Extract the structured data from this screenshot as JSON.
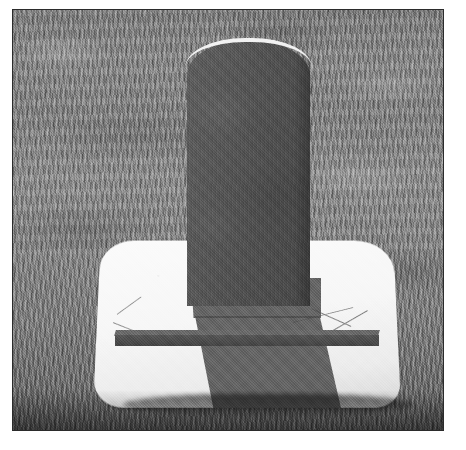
{
  "page": {
    "background_color": "#ffffff",
    "width": 466,
    "height": 450
  },
  "photo": {
    "title": "Grave marker on concrete base in mown cemetery lawn",
    "medium": "black-and-white photograph",
    "border_color": "#2b2b2b",
    "frame": {
      "left": 12,
      "top": 9,
      "width": 432,
      "height": 422
    }
  },
  "scene": {
    "background": {
      "name": "grass-lawn",
      "description": "mown turf with horizontal mower bands, mottled light and dark patches",
      "tone_color": "#868686"
    },
    "slab": {
      "name": "concrete-base-slab",
      "description": "bright white rounded-corner concrete foundation slab set flush in the grass",
      "color": "#f7f7f7",
      "edge_color": "#b4b4b4"
    },
    "headstone": {
      "name": "arched-headstone",
      "description": "upright dark granite marker with rounded arched top and bright sunlit rim",
      "color": "#535353",
      "highlight_color": "#f2f2f2",
      "inscription_lines": [
        "",
        "",
        "",
        ""
      ],
      "inscription_legible": false
    },
    "footstone": {
      "name": "flat-footstone-bar",
      "description": "low dark horizontal stone bar lying across the slab in front of the headstone",
      "color": "#4d4d4d"
    },
    "cast_shadow": {
      "name": "headstone-cast-shadow",
      "description": "long trapezoidal shadow thrown by the headstone down and to the right across the white slab",
      "color": "#4e4e4e"
    },
    "grass_blades": {
      "name": "loose-grass-blades",
      "description": "few thin dry grass stems lying over the right edge of the slab",
      "color": "#8a8a8a"
    },
    "ground_shadow": {
      "name": "front-ground-shadow",
      "description": "dark band of shaded grass along the front base of the slab",
      "color": "#141414"
    }
  }
}
